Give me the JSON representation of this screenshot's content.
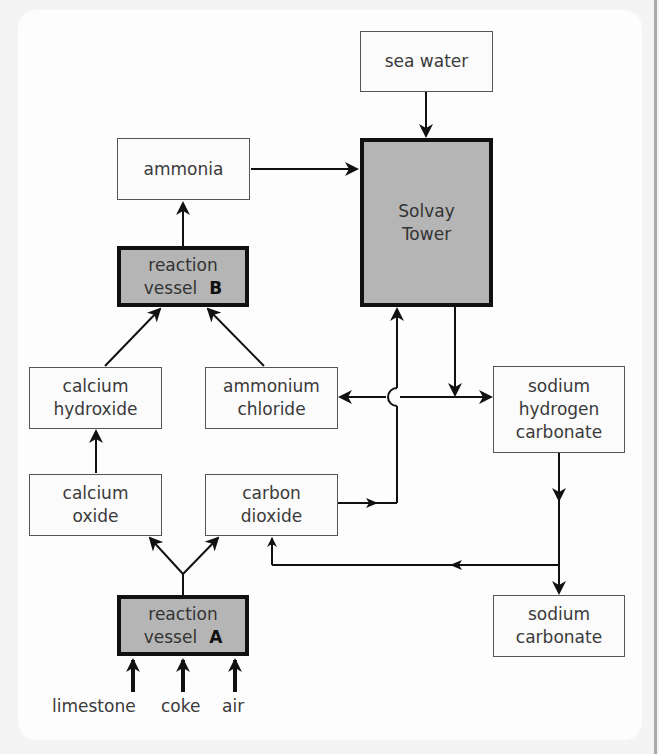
{
  "diagram": {
    "nodes": {
      "sea_water": {
        "line1": "sea water"
      },
      "ammonia": {
        "line1": "ammonia"
      },
      "solvay_tower": {
        "line1": "Solvay",
        "line2": "Tower"
      },
      "reaction_vessel_b": {
        "line1": "reaction",
        "line2": "vessel",
        "tag": "B"
      },
      "calcium_hydroxide": {
        "line1": "calcium",
        "line2": "hydroxide"
      },
      "ammonium_chloride": {
        "line1": "ammonium",
        "line2": "chloride"
      },
      "sodium_hydrogen_carbonate": {
        "line1": "sodium",
        "line2": "hydrogen",
        "line3": "carbonate"
      },
      "calcium_oxide": {
        "line1": "calcium",
        "line2": "oxide"
      },
      "carbon_dioxide": {
        "line1": "carbon",
        "line2": "dioxide"
      },
      "sodium_carbonate": {
        "line1": "sodium",
        "line2": "carbonate"
      },
      "reaction_vessel_a": {
        "line1": "reaction",
        "line2": "vessel",
        "tag": "A"
      }
    },
    "inputs": [
      "limestone",
      "coke",
      "air"
    ],
    "edges": [
      {
        "from": "sea water",
        "to": "Solvay Tower"
      },
      {
        "from": "ammonia",
        "to": "Solvay Tower"
      },
      {
        "from": "reaction vessel B",
        "to": "ammonia"
      },
      {
        "from": "calcium hydroxide",
        "to": "reaction vessel B"
      },
      {
        "from": "ammonium chloride",
        "to": "reaction vessel B"
      },
      {
        "from": "Solvay Tower",
        "to": "ammonium chloride"
      },
      {
        "from": "Solvay Tower",
        "to": "sodium hydrogen carbonate"
      },
      {
        "from": "carbon dioxide",
        "to": "Solvay Tower"
      },
      {
        "from": "calcium oxide",
        "to": "calcium hydroxide"
      },
      {
        "from": "reaction vessel A",
        "to": "calcium oxide"
      },
      {
        "from": "reaction vessel A",
        "to": "carbon dioxide"
      },
      {
        "from": "sodium hydrogen carbonate",
        "to": "sodium carbonate"
      },
      {
        "from": "sodium hydrogen carbonate",
        "to": "carbon dioxide"
      },
      {
        "from": "limestone",
        "to": "reaction vessel A"
      },
      {
        "from": "coke",
        "to": "reaction vessel A"
      },
      {
        "from": "air",
        "to": "reaction vessel A"
      }
    ],
    "colors": {
      "vessel_fill": "#b5b5b5",
      "box_fill": "#fbfbfb",
      "line": "#111111"
    }
  }
}
